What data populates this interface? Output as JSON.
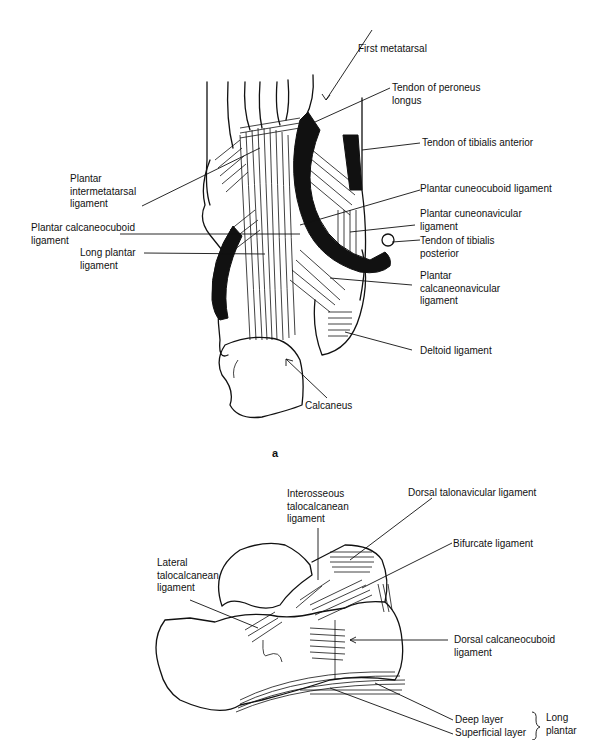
{
  "figure_a": {
    "caption": "a",
    "labels": {
      "first_metatarsal": "First metatarsal",
      "tendon_peroneus_longus": "Tendon of peroneus\nlongus",
      "tendon_tibialis_anterior": "Tendon of tibialis anterior",
      "plantar_intermetatarsal": "Plantar\nintermetatarsal\nligament",
      "plantar_cuneocuboid": "Plantar cuneocuboid ligament",
      "plantar_calcaneocuboid": "Plantar calcaneocuboid\nligament",
      "plantar_cuneonavicular": "Plantar cuneonavicular\nligament",
      "long_plantar": "Long plantar\nligament",
      "tendon_tibialis_posterior": "Tendon of tibialis\nposterior",
      "plantar_calcaneonavicular": "Plantar\ncalcaneonavicular\nligament",
      "deltoid": "Deltoid ligament",
      "calcaneus": "Calcaneus"
    }
  },
  "figure_b": {
    "labels": {
      "interosseous_talocalcanean": "Interosseous\ntalocalcanean\nligament",
      "dorsal_talonavicular": "Dorsal talonavicular ligament",
      "bifurcate": "Bifurcate ligament",
      "lateral_talocalcanean": "Lateral\ntalocalcanean\nligament",
      "dorsal_calcaneocuboid": "Dorsal calcaneocuboid\nligament",
      "deep_layer": "Deep layer",
      "superficial_layer": "Superficial layer",
      "long_plantar_group": "Long\nplantar"
    }
  }
}
